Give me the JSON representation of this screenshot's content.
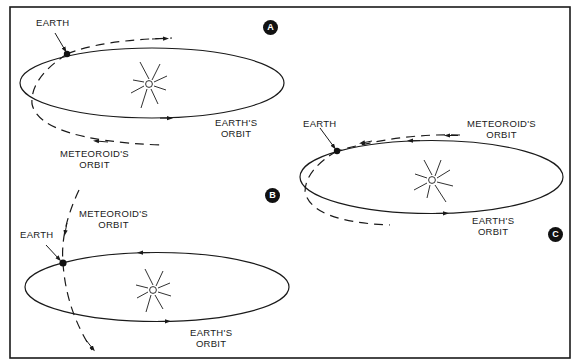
{
  "figure": {
    "colors": {
      "line": "#1a1a1a",
      "background": "#ffffff",
      "badge": "#111111"
    },
    "panels": [
      {
        "id": "A",
        "badge": "A",
        "earth_label": "EARTH",
        "earth_orbit_label": [
          "EARTH'S",
          "ORBIT"
        ],
        "meteoroid_orbit_label": [
          "METEOROID'S",
          "ORBIT"
        ]
      },
      {
        "id": "B",
        "badge": "B",
        "earth_label": "EARTH",
        "earth_orbit_label": [
          "EARTH'S",
          "ORBIT"
        ],
        "meteoroid_orbit_label": [
          "METEOROID'S",
          "ORBIT"
        ]
      },
      {
        "id": "C",
        "badge": "C",
        "earth_label": "EARTH",
        "earth_orbit_label": [
          "EARTH'S",
          "ORBIT"
        ],
        "meteoroid_orbit_label": [
          "METEOROID'S",
          "ORBIT"
        ]
      }
    ]
  }
}
